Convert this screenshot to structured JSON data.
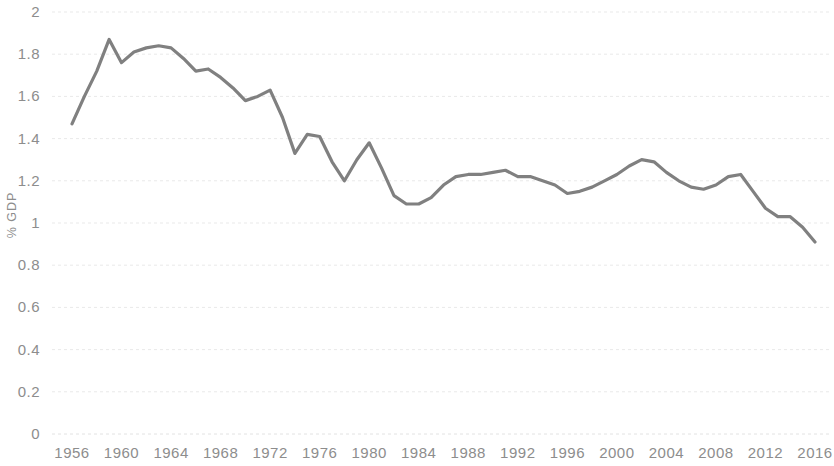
{
  "chart_data": {
    "type": "line",
    "title": "",
    "subtitle": "",
    "xlabel": "",
    "ylabel": "% GDP",
    "xlim": [
      1956,
      2016
    ],
    "ylim": [
      0,
      2
    ],
    "grid": true,
    "legend": null,
    "legend_position": "none",
    "line_color": "#808080",
    "axis_text_color": "#8d8d8d",
    "gridline_color": "#e9e9e9",
    "background_color": "#ffffff",
    "ytick_labels": [
      "0",
      "0.2",
      "0.4",
      "0.6",
      "0.8",
      "1",
      "1.2",
      "1.4",
      "1.6",
      "1.8",
      "2"
    ],
    "ytick_values": [
      0,
      0.2,
      0.4,
      0.6,
      0.8,
      1,
      1.2,
      1.4,
      1.6,
      1.8,
      2
    ],
    "xtick_labels": [
      "1956",
      "1960",
      "1964",
      "1968",
      "1972",
      "1976",
      "1980",
      "1984",
      "1988",
      "1992",
      "1996",
      "2000",
      "2004",
      "2008",
      "2012",
      "2016"
    ],
    "xtick_values": [
      1956,
      1960,
      1964,
      1968,
      1972,
      1976,
      1980,
      1984,
      1988,
      1992,
      1996,
      2000,
      2004,
      2008,
      2012,
      2016
    ],
    "x": [
      1956,
      1957,
      1958,
      1959,
      1960,
      1961,
      1962,
      1963,
      1964,
      1965,
      1966,
      1967,
      1968,
      1969,
      1970,
      1971,
      1972,
      1973,
      1974,
      1975,
      1976,
      1977,
      1978,
      1979,
      1980,
      1981,
      1982,
      1983,
      1984,
      1985,
      1986,
      1987,
      1988,
      1989,
      1990,
      1991,
      1992,
      1993,
      1994,
      1995,
      1996,
      1997,
      1998,
      1999,
      2000,
      2001,
      2002,
      2003,
      2004,
      2005,
      2006,
      2007,
      2008,
      2009,
      2010,
      2011,
      2012,
      2013,
      2014,
      2015,
      2016
    ],
    "values": [
      1.47,
      1.6,
      1.72,
      1.87,
      1.76,
      1.81,
      1.83,
      1.84,
      1.83,
      1.78,
      1.72,
      1.73,
      1.69,
      1.64,
      1.58,
      1.6,
      1.63,
      1.5,
      1.33,
      1.42,
      1.41,
      1.29,
      1.2,
      1.3,
      1.38,
      1.26,
      1.13,
      1.09,
      1.09,
      1.12,
      1.18,
      1.22,
      1.23,
      1.23,
      1.24,
      1.25,
      1.22,
      1.22,
      1.2,
      1.18,
      1.14,
      1.15,
      1.17,
      1.2,
      1.23,
      1.27,
      1.3,
      1.29,
      1.24,
      1.2,
      1.17,
      1.16,
      1.18,
      1.22,
      1.23,
      1.15,
      1.07,
      1.03,
      1.03,
      0.98,
      0.91
    ],
    "series": [
      {
        "name": "% GDP",
        "color": "#808080",
        "values": [
          1.47,
          1.6,
          1.72,
          1.87,
          1.76,
          1.81,
          1.83,
          1.84,
          1.83,
          1.78,
          1.72,
          1.73,
          1.69,
          1.64,
          1.58,
          1.6,
          1.63,
          1.5,
          1.33,
          1.42,
          1.41,
          1.29,
          1.2,
          1.3,
          1.38,
          1.26,
          1.13,
          1.09,
          1.09,
          1.12,
          1.18,
          1.22,
          1.23,
          1.23,
          1.24,
          1.25,
          1.22,
          1.22,
          1.2,
          1.18,
          1.14,
          1.15,
          1.17,
          1.2,
          1.23,
          1.27,
          1.3,
          1.29,
          1.24,
          1.2,
          1.17,
          1.16,
          1.18,
          1.22,
          1.23,
          1.15,
          1.07,
          1.03,
          1.03,
          0.98,
          0.91
        ]
      }
    ]
  }
}
